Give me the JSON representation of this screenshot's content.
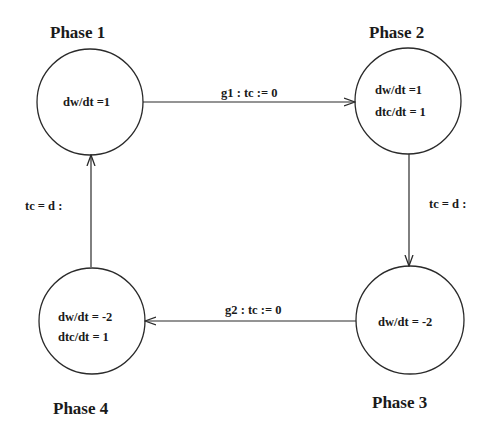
{
  "diagram": {
    "type": "hybrid-automaton-state-diagram",
    "states": [
      {
        "id": "phase1",
        "title": "Phase  1",
        "equations": [
          "dw/dt  =1"
        ]
      },
      {
        "id": "phase2",
        "title": "Phase  2",
        "equations": [
          "dw/dt  =1",
          "dtc/dt = 1"
        ]
      },
      {
        "id": "phase3",
        "title": "Phase  3",
        "equations": [
          "dw/dt = -2"
        ]
      },
      {
        "id": "phase4",
        "title": "Phase  4",
        "equations": [
          "dw/dt = -2",
          "dtc/dt = 1"
        ]
      }
    ],
    "transitions": [
      {
        "from": "phase1",
        "to": "phase2",
        "label": "g1 : tc := 0"
      },
      {
        "from": "phase2",
        "to": "phase3",
        "label": "tc = d :"
      },
      {
        "from": "phase3",
        "to": "phase4",
        "label": "g2 : tc := 0"
      },
      {
        "from": "phase4",
        "to": "phase1",
        "label": "tc = d :"
      }
    ],
    "colors": {
      "stroke": "#2a2a2a",
      "background": "#ffffff"
    }
  }
}
